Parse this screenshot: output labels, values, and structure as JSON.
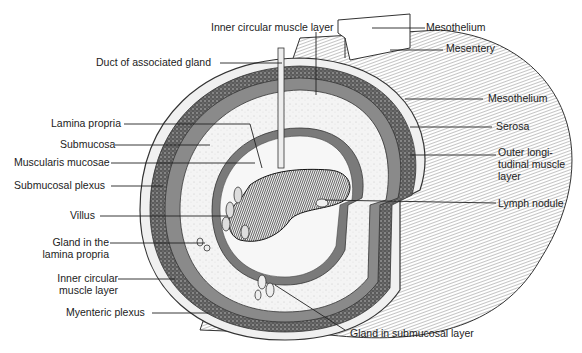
{
  "diagram": {
    "labels_top": {
      "inner_circular_muscle_top": "Inner circular muscle layer",
      "duct": "Duct of associated gland",
      "mesothelium_top": "Mesothelium",
      "mesentery": "Mesentery"
    },
    "labels_left": {
      "lamina_propria": "Lamina propria",
      "submucosa": "Submucosa",
      "muscularis_mucosae": "Muscularis mucosae",
      "submucosal_plexus": "Submucosal plexus",
      "villus": "Villus",
      "gland_lamina_1": "Gland in the",
      "gland_lamina_2": "lamina propria",
      "inner_circular_1": "Inner circular",
      "inner_circular_2": "muscle layer",
      "myenteric_plexus": "Myenteric plexus"
    },
    "labels_right": {
      "mesothelium": "Mesothelium",
      "serosa": "Serosa",
      "outer_long_1": "Outer longi-",
      "outer_long_2": "tudinal muscle",
      "outer_long_3": "layer",
      "lymph_nodule": "Lymph nodule"
    },
    "labels_bottom": {
      "gland_submucosal": "Gland in submucosal layer"
    },
    "colors": {
      "ink": "#222222",
      "muscle": "#6e6e6e",
      "lumen": "#1e1e1e",
      "paper": "#ffffff"
    }
  }
}
